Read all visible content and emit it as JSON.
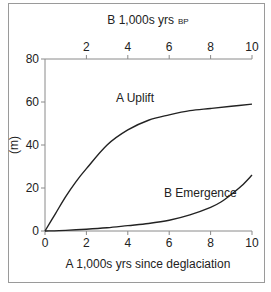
{
  "chart_data": {
    "type": "line",
    "title": "",
    "xlabel": "A  1,000s yrs since deglaciation",
    "x2label": "B  1,000s yrs",
    "x2label_suffix": "BP",
    "ylabel": "(m)",
    "xlim": [
      0,
      10
    ],
    "ylim": [
      0,
      80
    ],
    "x_ticks": [
      0,
      2,
      4,
      6,
      8,
      10
    ],
    "x2_ticks": [
      2,
      4,
      6,
      8,
      10
    ],
    "y_ticks": [
      0,
      20,
      40,
      60,
      80
    ],
    "grid": false,
    "legend": "inline labels",
    "series": [
      {
        "name": "A  Uplift",
        "x": [
          0,
          0.5,
          1,
          1.5,
          2,
          3,
          4,
          5,
          6,
          7,
          8,
          9,
          10
        ],
        "values": [
          0,
          8,
          16,
          23,
          29,
          40,
          47,
          51.5,
          54,
          56,
          57,
          58,
          59
        ]
      },
      {
        "name": "B  Emergence",
        "x": [
          0,
          1,
          2,
          3,
          4,
          5,
          6,
          7,
          8,
          8.5,
          9,
          9.5,
          10
        ],
        "values": [
          0,
          0.3,
          0.8,
          1.5,
          2.5,
          3.5,
          5,
          7.5,
          11,
          13.5,
          17,
          21,
          26
        ]
      }
    ]
  },
  "labels": {
    "top_axis_title": "B  1,000s yrs",
    "top_axis_suffix": "BP",
    "bottom_axis_title": "A  1,000s yrs since deglaciation",
    "y_axis_title": "(m)",
    "uplift_label": "A  Uplift",
    "emergence_label": "B  Emergence"
  }
}
